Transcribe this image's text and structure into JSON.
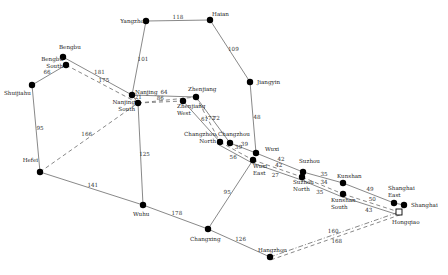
{
  "diagram": {
    "type": "rail-network",
    "nodes": [
      {
        "id": "Yangzhou",
        "label": [
          "Yangzho"
        ],
        "hollow": false
      },
      {
        "id": "Haian",
        "label": [
          "Haian"
        ],
        "hollow": false
      },
      {
        "id": "Bengbu",
        "label": [
          "Bengbu"
        ],
        "hollow": false
      },
      {
        "id": "BengbuSouth",
        "label": [
          "Bengbu",
          "South"
        ],
        "hollow": false
      },
      {
        "id": "Shuijiahu",
        "label": [
          "Shuijiahu"
        ],
        "hollow": false
      },
      {
        "id": "Nanjing",
        "label": [
          "Nanjing"
        ],
        "hollow": false
      },
      {
        "id": "NanjingSouth",
        "label": [
          "Nanjing",
          "South"
        ],
        "hollow": false
      },
      {
        "id": "Zhenjiang",
        "label": [
          "Zhenjiang"
        ],
        "hollow": false
      },
      {
        "id": "ZhenjiangWest",
        "label": [
          "Zhenjiang",
          "West"
        ],
        "hollow": false
      },
      {
        "id": "Jiangyin",
        "label": [
          "Jiangyin"
        ],
        "hollow": false
      },
      {
        "id": "ChangzhouNorth",
        "label": [
          "Changzhou",
          "North"
        ],
        "hollow": false
      },
      {
        "id": "Changzhou",
        "label": [
          "Changzhou"
        ],
        "hollow": false
      },
      {
        "id": "Wuxi",
        "label": [
          "Wuxi"
        ],
        "hollow": false
      },
      {
        "id": "WuxiEast",
        "label": [
          "Wuxi",
          "East"
        ],
        "hollow": false
      },
      {
        "id": "Suzhou",
        "label": [
          "Suzhou"
        ],
        "hollow": false
      },
      {
        "id": "SuzhouNorth",
        "label": [
          "Suzhou",
          "North"
        ],
        "hollow": false
      },
      {
        "id": "Kunshan",
        "label": [
          "Kunshan"
        ],
        "hollow": false
      },
      {
        "id": "KunshanSouth",
        "label": [
          "Kunshan",
          "South"
        ],
        "hollow": false
      },
      {
        "id": "ShanghaiEast",
        "label": [
          "Shanghai",
          "East"
        ],
        "hollow": false
      },
      {
        "id": "Shanghai",
        "label": [
          "Shanghai"
        ],
        "hollow": false
      },
      {
        "id": "Hongqiao",
        "label": [
          "Hongqiao"
        ],
        "hollow": true
      },
      {
        "id": "Hefei",
        "label": [
          "Hefei"
        ],
        "hollow": false
      },
      {
        "id": "Wuhu",
        "label": [
          "Wuhu"
        ],
        "hollow": false
      },
      {
        "id": "Changxing",
        "label": [
          "Changxing"
        ],
        "hollow": false
      },
      {
        "id": "Hangzhou",
        "label": [
          "Hangzhou"
        ],
        "hollow": false
      }
    ],
    "edges": [
      {
        "from": "Yangzhou",
        "to": "Haian",
        "weight": "118",
        "style": "solid"
      },
      {
        "from": "Haian",
        "to": "Jiangyin",
        "weight": "109",
        "style": "solid"
      },
      {
        "from": "Yangzhou",
        "to": "Nanjing",
        "weight": "101",
        "style": "solid"
      },
      {
        "from": "Jiangyin",
        "to": "Wuxi",
        "weight": "48",
        "style": "solid"
      },
      {
        "from": "Shuijiahu",
        "to": "BengbuSouth",
        "weight": "66",
        "style": "solid"
      },
      {
        "from": "Shuijiahu",
        "to": "Hefei",
        "weight": "95",
        "style": "solid"
      },
      {
        "from": "Bengbu",
        "to": "Nanjing",
        "weight": "181",
        "style": "solid"
      },
      {
        "from": "BengbuSouth",
        "to": "NanjingSouth",
        "weight": "175",
        "style": "dash"
      },
      {
        "from": "Nanjing",
        "to": "Zhenjiang",
        "weight": "64",
        "style": "solid"
      },
      {
        "from": "Nanjing",
        "to": "NanjingSouth",
        "weight": "21",
        "style": "solid"
      },
      {
        "from": "NanjingSouth",
        "to": "ZhenjiangWest",
        "weight": "86",
        "style": "dash"
      },
      {
        "from": "NanjingSouth",
        "to": "Zhenjiang",
        "weight": "",
        "style": "dash"
      },
      {
        "from": "Hefei",
        "to": "NanjingSouth",
        "weight": "166",
        "style": "dash"
      },
      {
        "from": "NanjingSouth",
        "to": "Wuhu",
        "weight": "125",
        "style": "solid"
      },
      {
        "from": "Zhenjiang",
        "to": "Changzhou",
        "weight": "72",
        "style": "solid"
      },
      {
        "from": "Zhenjiang",
        "to": "ChangzhouNorth",
        "weight": "72",
        "style": "dash"
      },
      {
        "from": "ZhenjiangWest",
        "to": "ChangzhouNorth",
        "weight": "61",
        "style": "solid"
      },
      {
        "from": "Changzhou",
        "to": "Wuxi",
        "weight": "39",
        "style": "solid"
      },
      {
        "from": "ChangzhouNorth",
        "to": "WuxiEast",
        "weight": "39",
        "style": "dash"
      },
      {
        "from": "ChangzhouNorth",
        "to": "WuxiEast",
        "weight": "56",
        "style": "solid"
      },
      {
        "from": "Wuxi",
        "to": "Suzhou",
        "weight": "42",
        "style": "solid"
      },
      {
        "from": "WuxiEast",
        "to": "SuzhouNorth",
        "weight": "42",
        "style": "dash"
      },
      {
        "from": "WuxiEast",
        "to": "SuzhouNorth",
        "weight": "27",
        "style": "solid"
      },
      {
        "from": "Suzhou",
        "to": "Kunshan",
        "weight": "35",
        "style": "solid"
      },
      {
        "from": "SuzhouNorth",
        "to": "KunshanSouth",
        "weight": "34",
        "style": "dash"
      },
      {
        "from": "SuzhouNorth",
        "to": "KunshanSouth",
        "weight": "35",
        "style": "solid"
      },
      {
        "from": "Kunshan",
        "to": "ShanghaiEast",
        "weight": "49",
        "style": "solid"
      },
      {
        "from": "KunshanSouth",
        "to": "Hongqiao",
        "weight": "50",
        "style": "dash"
      },
      {
        "from": "KunshanSouth",
        "to": "Hongqiao",
        "weight": "43",
        "style": "solid"
      },
      {
        "from": "ShanghaiEast",
        "to": "Shanghai",
        "weight": "",
        "style": "solid"
      },
      {
        "from": "Hefei",
        "to": "Wuhu",
        "weight": "141",
        "style": "solid"
      },
      {
        "from": "Wuhu",
        "to": "Changxing",
        "weight": "178",
        "style": "solid"
      },
      {
        "from": "Changxing",
        "to": "WuxiEast",
        "weight": "95",
        "style": "solid"
      },
      {
        "from": "Changxing",
        "to": "Hangzhou",
        "weight": "126",
        "style": "solid"
      },
      {
        "from": "Hangzhou",
        "to": "Hongqiao",
        "weight": "160",
        "style": "dashdot"
      },
      {
        "from": "Hangzhou",
        "to": "Hongqiao",
        "weight": "168",
        "style": "dash"
      }
    ]
  }
}
